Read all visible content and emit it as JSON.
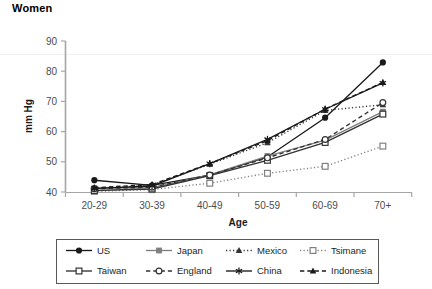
{
  "chart_data": {
    "type": "line",
    "title": "Women",
    "xlabel": "Age",
    "ylabel": "mm Hg",
    "categories": [
      "20-29",
      "30-39",
      "40-49",
      "50-59",
      "60-69",
      "70+"
    ],
    "ylim": [
      40,
      90
    ],
    "yticks": [
      40,
      50,
      60,
      70,
      80,
      90
    ],
    "grid": false,
    "legend_position": "bottom",
    "series": [
      {
        "name": "US",
        "marker": "filled-circle",
        "line": "solid",
        "color": "#1a1a1a",
        "values": [
          43.9,
          42.2,
          45.6,
          51.6,
          64.6,
          82.9
        ]
      },
      {
        "name": "Japan",
        "marker": "filled-square",
        "line": "solid",
        "color": "#7f7f7f",
        "values": [
          41.3,
          41.4,
          45.7,
          51.9,
          57.2,
          66.6
        ]
      },
      {
        "name": "Mexico",
        "marker": "filled-triangle",
        "line": "dotted",
        "color": "#333333",
        "values": [
          41.0,
          42.3,
          49.2,
          56.3,
          67.0,
          68.9
        ]
      },
      {
        "name": "Tsimane",
        "marker": "open-square",
        "line": "dotted",
        "color": "#808080",
        "values": [
          40.2,
          40.8,
          42.9,
          46.2,
          48.5,
          55.2
        ]
      },
      {
        "name": "Taiwan",
        "marker": "open-square",
        "line": "solid",
        "color": "#333333",
        "values": [
          40.5,
          41.0,
          45.4,
          50.5,
          56.4,
          65.8
        ]
      },
      {
        "name": "England",
        "marker": "open-circle",
        "line": "dashed",
        "color": "#333333",
        "values": [
          41.1,
          41.6,
          45.6,
          51.3,
          57.4,
          69.6
        ]
      },
      {
        "name": "China",
        "marker": "asterisk",
        "line": "solid",
        "color": "#1a1a1a",
        "values": [
          41.2,
          42.0,
          49.4,
          57.4,
          67.4,
          76.1
        ]
      },
      {
        "name": "Indonesia",
        "marker": "filled-triangle",
        "line": "dashed",
        "color": "#1a1a1a",
        "values": [
          41.4,
          42.5,
          49.4,
          57.0,
          67.5,
          76.3
        ]
      }
    ]
  },
  "axes": {
    "y_tick_labels": [
      "90",
      "80",
      "70",
      "60",
      "50",
      "40"
    ],
    "x_tick_labels": [
      "20-29",
      "30-39",
      "40-49",
      "50-59",
      "60-69",
      "70+"
    ],
    "y_axis_title": "mm Hg",
    "x_axis_title": "Age"
  },
  "legend": {
    "entries": [
      {
        "label": "US"
      },
      {
        "label": "Japan"
      },
      {
        "label": "Mexico"
      },
      {
        "label": "Tsimane"
      },
      {
        "label": "Taiwan"
      },
      {
        "label": "England"
      },
      {
        "label": "China"
      },
      {
        "label": "Indonesia"
      }
    ]
  }
}
